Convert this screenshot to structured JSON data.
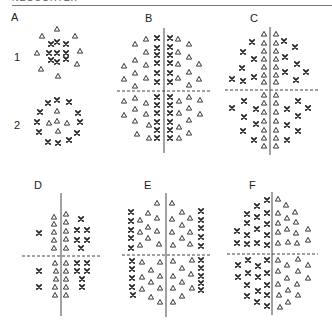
{
  "header": {
    "title": "NEOCORTEX"
  },
  "colors": {
    "ink": "#222222",
    "background": "#ffffff",
    "divider": "#444444"
  },
  "legend": {
    "cross": "x-symbol",
    "triangle": "triangle-symbol"
  },
  "panels": [
    {
      "id": "A",
      "label": "A",
      "label_pos": [
        14,
        18
      ],
      "rows": [
        {
          "label": "1",
          "label_pos": [
            17,
            58
          ]
        },
        {
          "label": "2",
          "label_pos": [
            17,
            126
          ]
        }
      ],
      "axes": null,
      "triangles": [
        [
          57,
          29
        ],
        [
          42,
          36
        ],
        [
          75,
          36
        ],
        [
          37,
          53
        ],
        [
          80,
          51
        ],
        [
          41,
          69
        ],
        [
          77,
          64
        ],
        [
          58,
          76
        ],
        [
          57,
          111
        ],
        [
          49,
          123
        ],
        [
          57,
          121
        ],
        [
          67,
          123
        ],
        [
          58,
          131
        ]
      ],
      "crosses": [
        [
          51,
          44
        ],
        [
          57,
          42
        ],
        [
          66,
          44
        ],
        [
          49,
          53
        ],
        [
          57,
          53
        ],
        [
          66,
          53
        ],
        [
          51,
          60
        ],
        [
          57,
          62
        ],
        [
          66,
          59
        ],
        [
          57,
          100
        ],
        [
          48,
          103
        ],
        [
          69,
          102
        ],
        [
          40,
          112
        ],
        [
          78,
          113
        ],
        [
          37,
          122
        ],
        [
          80,
          122
        ],
        [
          39,
          132
        ],
        [
          77,
          133
        ],
        [
          48,
          142
        ],
        [
          58,
          143
        ],
        [
          69,
          140
        ]
      ]
    },
    {
      "id": "B",
      "label": "B",
      "label_pos": [
        148,
        19
      ],
      "axes": {
        "vx": 164,
        "vy1": 28,
        "vy2": 153,
        "hy": 91,
        "hx1": 117,
        "hx2": 210
      },
      "triangles": [
        [
          146,
          39
        ],
        [
          135,
          44
        ],
        [
          146,
          52
        ],
        [
          135,
          60
        ],
        [
          124,
          66
        ],
        [
          146,
          65
        ],
        [
          135,
          73
        ],
        [
          124,
          79
        ],
        [
          146,
          78
        ],
        [
          135,
          86
        ],
        [
          178,
          39
        ],
        [
          189,
          44
        ],
        [
          178,
          52
        ],
        [
          189,
          57
        ],
        [
          199,
          64
        ],
        [
          178,
          64
        ],
        [
          189,
          72
        ],
        [
          199,
          79
        ],
        [
          178,
          78
        ],
        [
          189,
          85
        ],
        [
          124,
          101
        ],
        [
          135,
          98
        ],
        [
          146,
          103
        ],
        [
          124,
          115
        ],
        [
          135,
          109
        ],
        [
          146,
          114
        ],
        [
          135,
          121
        ],
        [
          149,
          125
        ],
        [
          137,
          134
        ],
        [
          149,
          138
        ],
        [
          179,
          101
        ],
        [
          189,
          97
        ],
        [
          200,
          100
        ],
        [
          179,
          113
        ],
        [
          189,
          108
        ],
        [
          200,
          114
        ],
        [
          179,
          127
        ],
        [
          189,
          120
        ],
        [
          189,
          133
        ],
        [
          179,
          138
        ]
      ],
      "crosses": [
        [
          157,
          38
        ],
        [
          157,
          48
        ],
        [
          157,
          55
        ],
        [
          157,
          63
        ],
        [
          157,
          73
        ],
        [
          157,
          82
        ],
        [
          170,
          38
        ],
        [
          170,
          47
        ],
        [
          170,
          55
        ],
        [
          170,
          63
        ],
        [
          170,
          73
        ],
        [
          170,
          82
        ],
        [
          157,
          97
        ],
        [
          157,
          105
        ],
        [
          157,
          113
        ],
        [
          157,
          122
        ],
        [
          157,
          130
        ],
        [
          157,
          138
        ],
        [
          170,
          97
        ],
        [
          170,
          105
        ],
        [
          170,
          113
        ],
        [
          170,
          122
        ],
        [
          170,
          130
        ],
        [
          170,
          138
        ]
      ]
    },
    {
      "id": "C",
      "label": "C",
      "label_pos": [
        253,
        19
      ],
      "axes": {
        "vx": 270,
        "vy1": 27,
        "vy2": 155,
        "hy": 90,
        "hx1": 225,
        "hx2": 318
      },
      "triangles": [
        [
          264,
          34
        ],
        [
          264,
          43
        ],
        [
          264,
          51
        ],
        [
          264,
          59
        ],
        [
          264,
          67
        ],
        [
          264,
          75
        ],
        [
          264,
          82
        ],
        [
          276,
          34
        ],
        [
          276,
          43
        ],
        [
          276,
          51
        ],
        [
          276,
          59
        ],
        [
          276,
          67
        ],
        [
          276,
          75
        ],
        [
          276,
          82
        ],
        [
          264,
          95
        ],
        [
          264,
          103
        ],
        [
          264,
          112
        ],
        [
          264,
          121
        ],
        [
          264,
          130
        ],
        [
          264,
          138
        ],
        [
          264,
          146
        ],
        [
          276,
          95
        ],
        [
          276,
          103
        ],
        [
          276,
          112
        ],
        [
          276,
          121
        ],
        [
          276,
          130
        ],
        [
          276,
          138
        ],
        [
          276,
          146
        ]
      ],
      "crosses": [
        [
          252,
          42
        ],
        [
          243,
          52
        ],
        [
          254,
          59
        ],
        [
          242,
          68
        ],
        [
          254,
          77
        ],
        [
          232,
          79
        ],
        [
          243,
          81
        ],
        [
          284,
          41
        ],
        [
          295,
          47
        ],
        [
          285,
          57
        ],
        [
          297,
          64
        ],
        [
          285,
          72
        ],
        [
          306,
          72
        ],
        [
          296,
          80
        ],
        [
          244,
          101
        ],
        [
          232,
          108
        ],
        [
          256,
          109
        ],
        [
          244,
          117
        ],
        [
          256,
          124
        ],
        [
          243,
          131
        ],
        [
          254,
          140
        ],
        [
          298,
          101
        ],
        [
          308,
          108
        ],
        [
          287,
          109
        ],
        [
          298,
          116
        ],
        [
          287,
          125
        ],
        [
          298,
          131
        ],
        [
          287,
          140
        ]
      ]
    },
    {
      "id": "D",
      "label": "D",
      "label_pos": [
        37,
        186
      ],
      "axes": {
        "vx": 61,
        "vy1": 193,
        "vy2": 316,
        "hy": 256,
        "hx1": 22,
        "hx2": 100
      },
      "triangles": [
        [
          54,
          217
        ],
        [
          54,
          224
        ],
        [
          54,
          232
        ],
        [
          54,
          240
        ],
        [
          54,
          248
        ],
        [
          66,
          214
        ],
        [
          66,
          222
        ],
        [
          66,
          231
        ],
        [
          66,
          239
        ],
        [
          66,
          248
        ],
        [
          55,
          263
        ],
        [
          56,
          271
        ],
        [
          56,
          279
        ],
        [
          55,
          287
        ],
        [
          55,
          295
        ],
        [
          66,
          263
        ],
        [
          66,
          271
        ],
        [
          66,
          279
        ],
        [
          66,
          287
        ],
        [
          66,
          295
        ]
      ],
      "crosses": [
        [
          39,
          233
        ],
        [
          81,
          219
        ],
        [
          77,
          230
        ],
        [
          87,
          230
        ],
        [
          77,
          240
        ],
        [
          87,
          240
        ],
        [
          81,
          248
        ],
        [
          39,
          271
        ],
        [
          39,
          287
        ],
        [
          77,
          263
        ],
        [
          87,
          263
        ],
        [
          77,
          271
        ],
        [
          87,
          271
        ],
        [
          82,
          279
        ],
        [
          82,
          287
        ]
      ]
    },
    {
      "id": "E",
      "label": "E",
      "label_pos": [
        147,
        186
      ],
      "axes": {
        "vx": 166,
        "vy1": 193,
        "vy2": 317,
        "hy": 255,
        "hx1": 122,
        "hx2": 212
      },
      "triangles": [
        [
          157,
          203
        ],
        [
          148,
          213
        ],
        [
          140,
          220
        ],
        [
          157,
          218
        ],
        [
          148,
          227
        ],
        [
          140,
          232
        ],
        [
          157,
          231
        ],
        [
          148,
          238
        ],
        [
          140,
          245
        ],
        [
          159,
          244
        ],
        [
          172,
          203
        ],
        [
          182,
          212
        ],
        [
          190,
          218
        ],
        [
          172,
          219
        ],
        [
          182,
          225
        ],
        [
          190,
          232
        ],
        [
          172,
          232
        ],
        [
          182,
          238
        ],
        [
          190,
          244
        ],
        [
          173,
          245
        ],
        [
          142,
          262
        ],
        [
          160,
          262
        ],
        [
          151,
          270
        ],
        [
          142,
          277
        ],
        [
          160,
          276
        ],
        [
          151,
          282
        ],
        [
          142,
          289
        ],
        [
          160,
          288
        ],
        [
          151,
          297
        ],
        [
          160,
          302
        ],
        [
          173,
          261
        ],
        [
          192,
          260
        ],
        [
          182,
          268
        ],
        [
          173,
          276
        ],
        [
          191,
          274
        ],
        [
          182,
          282
        ],
        [
          173,
          288
        ],
        [
          192,
          288
        ],
        [
          182,
          296
        ],
        [
          173,
          302
        ]
      ],
      "crosses": [
        [
          131,
          212
        ],
        [
          131,
          221
        ],
        [
          131,
          230
        ],
        [
          131,
          238
        ],
        [
          131,
          248
        ],
        [
          201,
          211
        ],
        [
          201,
          220
        ],
        [
          201,
          228
        ],
        [
          201,
          237
        ],
        [
          201,
          246
        ],
        [
          132,
          261
        ],
        [
          132,
          269
        ],
        [
          132,
          278
        ],
        [
          132,
          287
        ],
        [
          133,
          295
        ],
        [
          201,
          260
        ],
        [
          201,
          268
        ],
        [
          201,
          276
        ],
        [
          201,
          283
        ],
        [
          201,
          290
        ]
      ]
    },
    {
      "id": "F",
      "label": "F",
      "label_pos": [
        252,
        186
      ],
      "axes": {
        "vx": 272,
        "vy1": 192,
        "vy2": 315,
        "hy": 254,
        "hx1": 227,
        "hx2": 318
      },
      "triangles": [
        [
          278,
          199
        ],
        [
          286,
          205
        ],
        [
          278,
          213
        ],
        [
          295,
          212
        ],
        [
          287,
          218
        ],
        [
          278,
          223
        ],
        [
          296,
          222
        ],
        [
          287,
          229
        ],
        [
          278,
          232
        ],
        [
          296,
          233
        ],
        [
          308,
          229
        ],
        [
          288,
          242
        ],
        [
          278,
          243
        ],
        [
          297,
          243
        ],
        [
          308,
          240
        ],
        [
          278,
          260
        ],
        [
          298,
          259
        ],
        [
          287,
          265
        ],
        [
          308,
          265
        ],
        [
          278,
          271
        ],
        [
          298,
          271
        ],
        [
          308,
          278
        ],
        [
          287,
          278
        ],
        [
          278,
          284
        ],
        [
          297,
          284
        ],
        [
          288,
          290
        ],
        [
          279,
          295
        ],
        [
          298,
          295
        ],
        [
          288,
          302
        ],
        [
          280,
          307
        ]
      ],
      "crosses": [
        [
          267,
          200
        ],
        [
          257,
          206
        ],
        [
          267,
          213
        ],
        [
          247,
          214
        ],
        [
          257,
          217
        ],
        [
          247,
          223
        ],
        [
          267,
          224
        ],
        [
          237,
          231
        ],
        [
          257,
          229
        ],
        [
          247,
          235
        ],
        [
          267,
          235
        ],
        [
          237,
          243
        ],
        [
          247,
          244
        ],
        [
          257,
          243
        ],
        [
          267,
          245
        ],
        [
          267,
          260
        ],
        [
          248,
          260
        ],
        [
          258,
          266
        ],
        [
          238,
          265
        ],
        [
          267,
          273
        ],
        [
          248,
          273
        ],
        [
          238,
          277
        ],
        [
          258,
          277
        ],
        [
          247,
          285
        ],
        [
          267,
          285
        ],
        [
          258,
          291
        ],
        [
          247,
          296
        ],
        [
          267,
          295
        ],
        [
          257,
          302
        ],
        [
          267,
          306
        ]
      ]
    }
  ]
}
